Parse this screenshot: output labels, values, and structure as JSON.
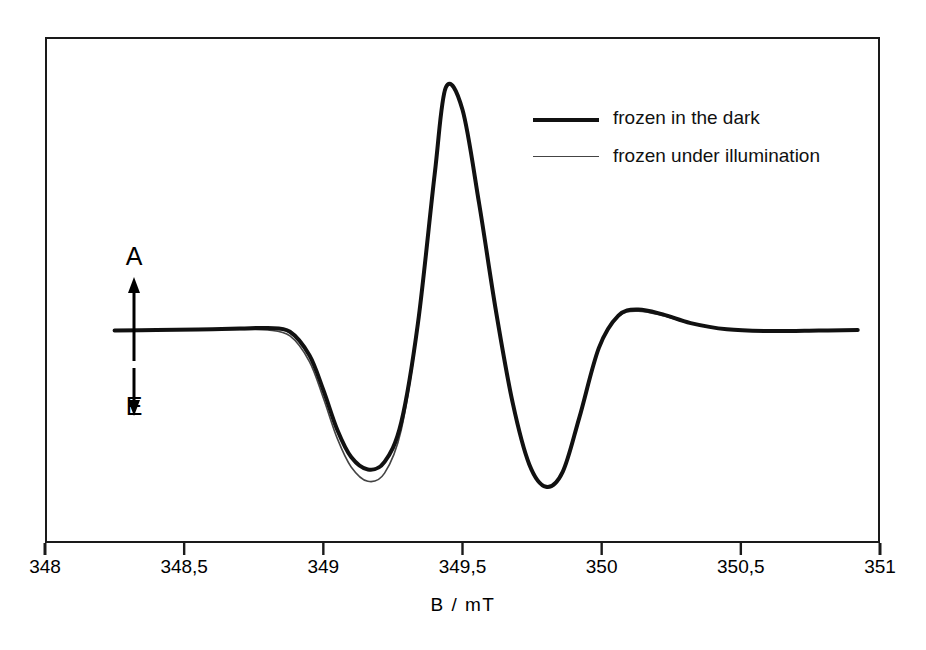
{
  "figure": {
    "background_color": "#ffffff",
    "frame_color": "#1a1a1a"
  },
  "axis_annotation": {
    "up_label": "A",
    "down_label": "E",
    "up_icon": "up-arrow-icon",
    "down_icon": "down-arrow-icon"
  },
  "legend": {
    "entries": [
      {
        "label": "frozen in the dark",
        "style": "thick",
        "color": "#111111"
      },
      {
        "label": "frozen under illumination",
        "style": "thin",
        "color": "#444444"
      }
    ]
  },
  "chart_data": {
    "type": "line",
    "title": "",
    "subtitle": "",
    "xlabel": "B  /  mT",
    "ylabel": "",
    "xlim": [
      348,
      351
    ],
    "ylim": [
      -0.62,
      1.05
    ],
    "grid": false,
    "legend_position": "top-right",
    "annotations": [
      {
        "text": "A",
        "meaning": "absorption",
        "position": "above-baseline-arrow-up"
      },
      {
        "text": "E",
        "meaning": "emission",
        "position": "below-baseline-arrow-down"
      }
    ],
    "xticks": [
      348,
      348.5,
      349,
      349.5,
      350,
      350.5,
      351
    ],
    "xtick_labels": [
      "348",
      "348,5",
      "349",
      "349,5",
      "350",
      "350,5",
      "351"
    ],
    "series": [
      {
        "name": "frozen in the dark",
        "color": "#111111",
        "linewidth": 4,
        "x": [
          348.25,
          348.4,
          348.55,
          348.7,
          348.8,
          348.88,
          348.95,
          349.0,
          349.05,
          349.1,
          349.16,
          349.22,
          349.28,
          349.34,
          349.4,
          349.44,
          349.5,
          349.56,
          349.62,
          349.68,
          349.74,
          349.8,
          349.86,
          349.92,
          349.99,
          350.06,
          350.13,
          350.22,
          350.32,
          350.45,
          350.6,
          350.78,
          350.92
        ],
        "y": [
          0.01,
          0.012,
          0.014,
          0.018,
          0.02,
          0.005,
          -0.09,
          -0.23,
          -0.39,
          -0.5,
          -0.55,
          -0.52,
          -0.36,
          0.04,
          0.64,
          0.99,
          0.9,
          0.52,
          0.09,
          -0.28,
          -0.53,
          -0.62,
          -0.56,
          -0.34,
          -0.06,
          0.07,
          0.095,
          0.075,
          0.04,
          0.015,
          0.008,
          0.01,
          0.012
        ]
      },
      {
        "name": "frozen under illumination",
        "color": "#444444",
        "linewidth": 1.6,
        "x": [
          348.25,
          348.4,
          348.55,
          348.7,
          348.8,
          348.88,
          348.95,
          349.0,
          349.05,
          349.1,
          349.16,
          349.22,
          349.28,
          349.34,
          349.4,
          349.44,
          349.5,
          349.56,
          349.62,
          349.68,
          349.74,
          349.8,
          349.86,
          349.92,
          349.99,
          350.06,
          350.13,
          350.22,
          350.32,
          350.45,
          350.6,
          350.78,
          350.92
        ],
        "y": [
          0.01,
          0.012,
          0.013,
          0.014,
          0.012,
          -0.012,
          -0.115,
          -0.262,
          -0.425,
          -0.54,
          -0.598,
          -0.565,
          -0.39,
          0.03,
          0.64,
          0.99,
          0.9,
          0.52,
          0.09,
          -0.28,
          -0.53,
          -0.62,
          -0.56,
          -0.34,
          -0.06,
          0.066,
          0.088,
          0.07,
          0.038,
          0.014,
          0.007,
          0.009,
          0.011
        ]
      }
    ]
  }
}
